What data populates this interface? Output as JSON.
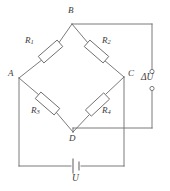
{
  "diagram": {
    "type": "schematic",
    "stroke_color": "#6b6b6b",
    "label_color": "#3a3a3a",
    "background": "#ffffff"
  },
  "nodes": [
    {
      "id": "B",
      "label": "B",
      "x": 72,
      "y": 24,
      "label_x": 68,
      "label_y": 8
    },
    {
      "id": "A",
      "label": "A",
      "x": 19,
      "y": 78,
      "label_x": 8,
      "label_y": 70
    },
    {
      "id": "C",
      "label": "C",
      "x": 124,
      "y": 77,
      "label_x": 129,
      "label_y": 70
    },
    {
      "id": "D",
      "label": "D",
      "x": 73,
      "y": 132,
      "label_x": 69,
      "label_y": 136
    }
  ],
  "resistors": [
    {
      "id": "R1",
      "label": "R",
      "sub": "1",
      "from": "A",
      "to": "B",
      "label_x": 25,
      "label_y": 37
    },
    {
      "id": "R2",
      "label": "R",
      "sub": "2",
      "from": "B",
      "to": "C",
      "label_x": 103,
      "label_y": 37
    },
    {
      "id": "R3",
      "label": "R",
      "sub": "3",
      "from": "A",
      "to": "D",
      "label_x": 31,
      "label_y": 107
    },
    {
      "id": "R4",
      "label": "R",
      "sub": "4",
      "from": "D",
      "to": "C",
      "label_x": 103,
      "label_y": 107
    }
  ],
  "sources": [
    {
      "id": "deltaU",
      "label": "ΔU",
      "kind": "output-terminals",
      "label_x": 148,
      "label_y": 73,
      "terminal_top": {
        "x": 152,
        "y": 72
      },
      "terminal_bottom": {
        "x": 152,
        "y": 88
      }
    },
    {
      "id": "U",
      "label": "U",
      "kind": "battery",
      "label_x": 73,
      "label_y": 170,
      "x": 76,
      "y": 166
    }
  ]
}
